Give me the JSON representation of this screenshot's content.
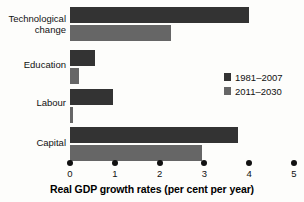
{
  "chart_data": {
    "type": "bar",
    "orientation": "horizontal",
    "title": "",
    "xlabel": "Real GDP growth rates (per cent per year)",
    "ylabel": "",
    "xlim": [
      0,
      5
    ],
    "xticks": [
      0,
      1,
      2,
      3,
      4,
      5
    ],
    "xtick_labels": [
      "0",
      "1",
      "2",
      "3",
      "4",
      "5"
    ],
    "grid": false,
    "legend_position": "right-middle",
    "categories": [
      "Technological change",
      "Education",
      "Labour",
      "Capital"
    ],
    "series": [
      {
        "name": "1981–2007",
        "color": "#333333",
        "values": [
          4.0,
          0.55,
          0.95,
          3.75
        ]
      },
      {
        "name": "2011–2030",
        "color": "#666666",
        "values": [
          2.25,
          0.2,
          0.07,
          2.95
        ]
      }
    ]
  },
  "legend": {
    "items": [
      {
        "label": "1981–2007",
        "color": "#333333"
      },
      {
        "label": "2011–2030",
        "color": "#666666"
      }
    ]
  },
  "axis": {
    "title": "Real GDP growth rates (per cent per year)",
    "tick_labels": [
      "0",
      "1",
      "2",
      "3",
      "4",
      "5"
    ]
  },
  "categories": [
    {
      "label": "Technological\nchange"
    },
    {
      "label": "Education"
    },
    {
      "label": "Labour"
    },
    {
      "label": "Capital"
    }
  ]
}
